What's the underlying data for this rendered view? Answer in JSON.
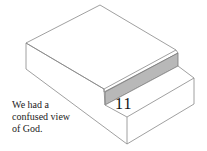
{
  "diagram": {
    "step_number": "11",
    "caption_lines": [
      "We had a",
      "confused view",
      "of God."
    ],
    "colors": {
      "line": "#777777",
      "shade": "#b8b8b8",
      "background": "#ffffff"
    }
  }
}
